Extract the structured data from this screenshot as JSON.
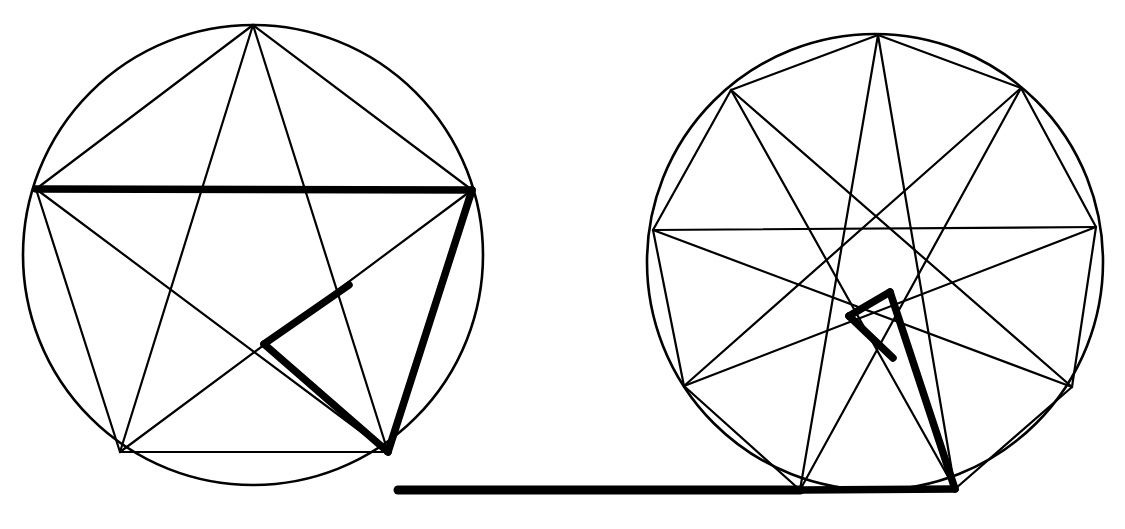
{
  "page": {
    "background_color": "#ffffff",
    "stroke_color": "#000000",
    "width": 1125,
    "height": 529
  },
  "style": {
    "thin_width": 2.2,
    "bold_width": 7.5,
    "circle_width": 2.6,
    "line_cap": "round",
    "fill": "none"
  },
  "figures": [
    {
      "id": "left-figure",
      "name": "pentagram-in-circle",
      "label": "Pentagon with inscribed pentagram",
      "vertex_count": 5,
      "circle": {
        "cx": 253,
        "cy": 255,
        "r": 230
      },
      "vertices": [
        {
          "id": "P0",
          "label": "top",
          "x": 253,
          "y": 25
        },
        {
          "id": "P1",
          "label": "right",
          "x": 472,
          "y": 190
        },
        {
          "id": "P2",
          "label": "bottom-right",
          "x": 388,
          "y": 452
        },
        {
          "id": "P3",
          "label": "bottom-left",
          "x": 120,
          "y": 452
        },
        {
          "id": "P4",
          "label": "left",
          "x": 36,
          "y": 189
        }
      ],
      "polygon_edges": [
        [
          "P0",
          "P1"
        ],
        [
          "P1",
          "P2"
        ],
        [
          "P2",
          "P3"
        ],
        [
          "P3",
          "P4"
        ],
        [
          "P4",
          "P0"
        ]
      ],
      "star_edges": [
        [
          "P0",
          "P2"
        ],
        [
          "P2",
          "P4"
        ],
        [
          "P4",
          "P1"
        ],
        [
          "P1",
          "P3"
        ],
        [
          "P3",
          "P0"
        ]
      ],
      "bold_path": [
        {
          "from": {
            "x": 36,
            "y": 189
          },
          "to": {
            "x": 472,
            "y": 190
          },
          "name": "left-to-right-chord"
        },
        {
          "from": {
            "x": 472,
            "y": 190
          },
          "to": {
            "x": 388,
            "y": 452
          },
          "name": "right-to-bottom-right-edge"
        },
        {
          "from": {
            "x": 388,
            "y": 452
          },
          "to": {
            "x": 264,
            "y": 344
          },
          "name": "bottom-right-to-star-node"
        },
        {
          "from": {
            "x": 264,
            "y": 344
          },
          "to": {
            "x": 349,
            "y": 285
          },
          "name": "star-node-to-upper-node"
        }
      ]
    },
    {
      "id": "right-figure",
      "name": "heptagram-in-circle",
      "label": "Heptagon with inscribed heptagram",
      "vertex_count": 7,
      "circle": {
        "cx": 875,
        "cy": 262,
        "r": 228
      },
      "vertices": [
        {
          "id": "H0",
          "label": "top",
          "x": 878,
          "y": 35
        },
        {
          "id": "H1",
          "label": "upper-right",
          "x": 1021,
          "y": 88
        },
        {
          "id": "H2",
          "label": "right",
          "x": 1096,
          "y": 227
        },
        {
          "id": "H3",
          "label": "lower-right",
          "x": 1072,
          "y": 387
        },
        {
          "id": "H4",
          "label": "bottom-right",
          "x": 955,
          "y": 489
        },
        {
          "id": "H5",
          "label": "bottom-left",
          "x": 800,
          "y": 490
        },
        {
          "id": "H6",
          "label": "lower-left",
          "x": 684,
          "y": 386
        },
        {
          "id": "H7",
          "label": "left",
          "x": 653,
          "y": 230
        },
        {
          "id": "H8",
          "label": "upper-left",
          "x": 731,
          "y": 90
        }
      ],
      "polygon_edges": [
        [
          "H0",
          "H1"
        ],
        [
          "H1",
          "H2"
        ],
        [
          "H2",
          "H3"
        ],
        [
          "H3",
          "H4"
        ],
        [
          "H4",
          "H5"
        ],
        [
          "H5",
          "H6"
        ],
        [
          "H6",
          "H7"
        ],
        [
          "H7",
          "H8"
        ],
        [
          "H8",
          "H0"
        ]
      ],
      "chord_edges": [
        [
          "H7",
          "H2"
        ],
        [
          "H8",
          "H3"
        ],
        [
          "H8",
          "H4"
        ],
        [
          "H0",
          "H5"
        ],
        [
          "H0",
          "H4"
        ],
        [
          "H1",
          "H6"
        ],
        [
          "H1",
          "H5"
        ],
        [
          "H2",
          "H6"
        ],
        [
          "H7",
          "H3"
        ]
      ],
      "bold_path": [
        {
          "from": {
            "x": 800,
            "y": 490
          },
          "to": {
            "x": 955,
            "y": 489
          },
          "name": "bottom-chord"
        },
        {
          "from": {
            "x": 955,
            "y": 489
          },
          "to": {
            "x": 890,
            "y": 292
          },
          "name": "bottom-right-to-inner-node"
        },
        {
          "from": {
            "x": 890,
            "y": 292
          },
          "to": {
            "x": 849,
            "y": 316
          },
          "name": "inner-node-to-left-node"
        },
        {
          "from": {
            "x": 849,
            "y": 316
          },
          "to": {
            "x": 893,
            "y": 358
          },
          "name": "left-node-to-lower-node"
        }
      ]
    }
  ],
  "connector": {
    "id": "bridge-line",
    "name": "connecting-segment",
    "label": "Thick bridge joining the two figures",
    "from": {
      "x": 398,
      "y": 490
    },
    "to": {
      "x": 800,
      "y": 490
    },
    "width": 9
  }
}
